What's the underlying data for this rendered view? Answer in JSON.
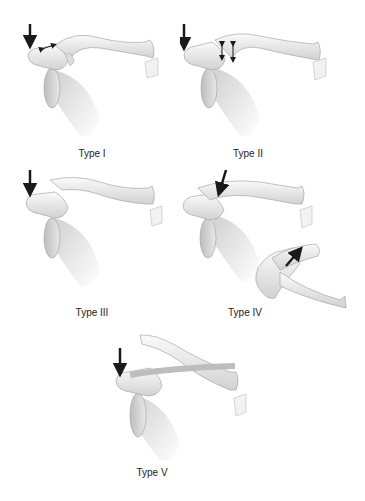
{
  "figure": {
    "panels": [
      {
        "id": "type-1",
        "label": "Type I"
      },
      {
        "id": "type-2",
        "label": "Type II"
      },
      {
        "id": "type-3",
        "label": "Type III"
      },
      {
        "id": "type-4",
        "label": "Type IV"
      },
      {
        "id": "type-5",
        "label": "Type V"
      }
    ],
    "colors": {
      "bone_fill": "#efefef",
      "bone_shade": "#c8c8c8",
      "outline": "#9a9a9a",
      "arrow": "#1a1a1a",
      "scapula_shade": "#d6d6d6"
    }
  }
}
